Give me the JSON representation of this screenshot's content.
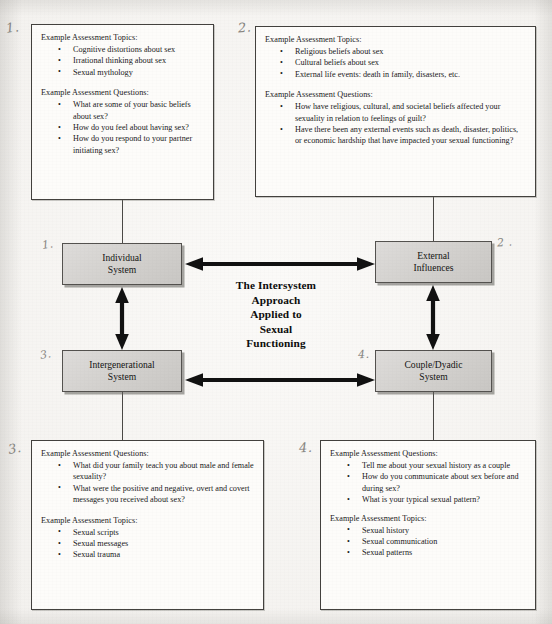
{
  "figure": {
    "center_title_lines": [
      "The Intersystem",
      "Approach",
      "Applied to",
      "Sexual",
      "Functioning"
    ],
    "heading_topics": "Example Assessment Topics:",
    "heading_questions": "Example Assessment Questions:",
    "bullet_glyph": "•",
    "colors": {
      "page_background": "#f0eeeb",
      "textbox_fill": "#fdfcfa",
      "textbox_border": "#43413e",
      "systembox_fill": "#d2d0cd",
      "systembox_border": "#54524f",
      "arrow": "#111111",
      "pencil_annotation": "#6f6d68"
    }
  },
  "system_boxes": [
    {
      "id": "individual",
      "number": "1.",
      "lines": [
        "Individual",
        "System"
      ]
    },
    {
      "id": "external",
      "number": "2 .",
      "lines": [
        "External",
        "Influences"
      ]
    },
    {
      "id": "intergenerational",
      "number": "3.",
      "lines": [
        "Intergenerational",
        "System"
      ]
    },
    {
      "id": "couple-dyadic",
      "number": "4.",
      "lines": [
        "Couple/Dyadic",
        "System"
      ]
    }
  ],
  "panels": [
    {
      "id": "individual-system-panel",
      "number": "1.",
      "position": "top-left",
      "sections": [
        {
          "heading": "Example Assessment Topics:",
          "items": [
            "Cognitive distortions about sex",
            "Irrational thinking about sex",
            "Sexual mythology"
          ]
        },
        {
          "heading": "Example Assessment Questions:",
          "items": [
            "What are some of your basic beliefs about sex?",
            "How do you feel about having sex?",
            "How do you respond to your partner initiating sex?"
          ]
        }
      ]
    },
    {
      "id": "external-influences-panel",
      "number": "2.",
      "position": "top-right",
      "sections": [
        {
          "heading": "Example Assessment Topics:",
          "items": [
            "Religious beliefs about sex",
            "Cultural beliefs about sex",
            "External life events: death in family, disasters, etc."
          ]
        },
        {
          "heading": "Example Assessment Questions:",
          "items": [
            "How have religious, cultural, and societal beliefs affected your sexuality in relation to feelings of guilt?",
            "Have there been any external events such as death, disaster, politics, or economic hardship that have impacted your sexual functioning?"
          ]
        }
      ]
    },
    {
      "id": "intergenerational-system-panel",
      "number": "3.",
      "position": "bottom-left",
      "sections": [
        {
          "heading": "Example Assessment Questions:",
          "items": [
            "What did your family teach you about male and female sexuality?",
            "What were the positive and negative, overt and covert messages you received about sex?"
          ]
        },
        {
          "heading": "Example Assessment Topics:",
          "items": [
            "Sexual scripts",
            "Sexual messages",
            "Sexual trauma"
          ]
        }
      ]
    },
    {
      "id": "couple-dyadic-system-panel",
      "number": "4.",
      "position": "bottom-right",
      "sections": [
        {
          "heading": "Example Assessment Questions:",
          "items": [
            "Tell me about your sexual history as a couple",
            "How do you communicate about sex before and during sex?",
            "What is your typical sexual pattern?"
          ]
        },
        {
          "heading": "Example Assessment Topics:",
          "items": [
            "Sexual history",
            "Sexual communication",
            "Sexual patterns"
          ]
        }
      ]
    }
  ],
  "connections": [
    {
      "id": "individual-external",
      "from": "Individual System",
      "to": "External Influences",
      "style": "double-headed-horizontal-arrow"
    },
    {
      "id": "intergenerational-couple",
      "from": "Intergenerational System",
      "to": "Couple/Dyadic System",
      "style": "double-headed-horizontal-arrow"
    },
    {
      "id": "individual-intergenerational",
      "from": "Individual System",
      "to": "Intergenerational System",
      "style": "double-headed-vertical-arrow"
    },
    {
      "id": "external-couple",
      "from": "External Influences",
      "to": "Couple/Dyadic System",
      "style": "double-headed-vertical-arrow"
    }
  ]
}
